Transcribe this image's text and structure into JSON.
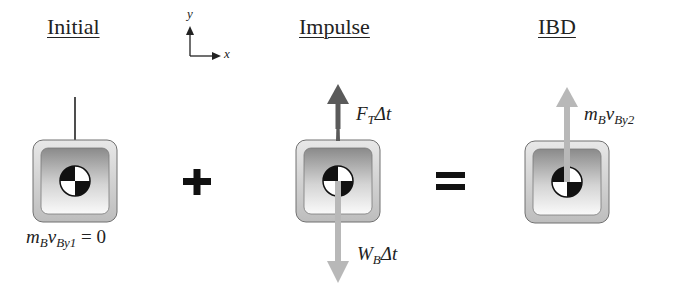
{
  "panels": [
    {
      "title": "Initial",
      "label": {
        "m": "m",
        "m_sub": "B",
        "v": "v",
        "v_sub": "By1",
        "suffix": " = 0"
      }
    },
    {
      "title": "Impulse",
      "up_label": {
        "base": "F",
        "sub": "T",
        "tail": "Δt"
      },
      "down_label": {
        "base": "W",
        "sub": "B",
        "tail": "Δt"
      }
    },
    {
      "title": "IBD",
      "label": {
        "m": "m",
        "m_sub": "B",
        "v": "v",
        "v_sub": "By2"
      }
    }
  ],
  "operators": {
    "plus": "+",
    "equals": "="
  },
  "axes": {
    "x": "x",
    "y": "y"
  },
  "colors": {
    "dark_arrow": "#5a5a5a",
    "light_arrow": "#b8b8b8",
    "text": "#222222"
  }
}
